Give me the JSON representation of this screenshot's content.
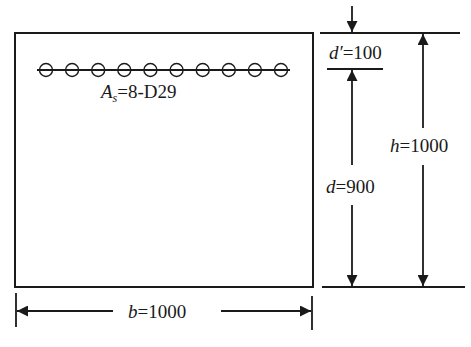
{
  "diagram": {
    "type": "beam cross-section",
    "stroke_color": "#1a1a1a",
    "background": "#ffffff",
    "section": {
      "width_label": {
        "var": "b",
        "eq": "=1000"
      },
      "height_label": {
        "var": "h",
        "eq": "=1000"
      }
    },
    "reinforcement": {
      "bar_count_drawn": 10,
      "label_var": "A",
      "label_sub": "s",
      "label_eq": "=8-D29"
    },
    "dimensions": {
      "cover": {
        "var": "d",
        "prime": "′",
        "eq": "=100"
      },
      "effective_depth": {
        "var": "d",
        "eq": "=900"
      }
    }
  }
}
